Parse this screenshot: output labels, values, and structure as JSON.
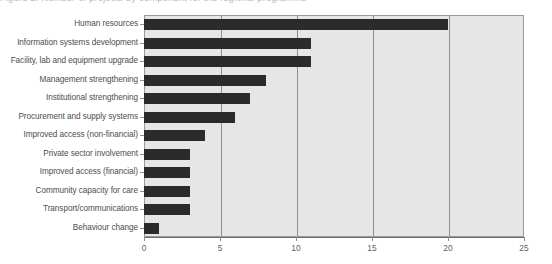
{
  "figure": {
    "cut_off_title": "Figure 2. Number of projects by component for the regional programme",
    "plot_background_color": "#e6e6e6",
    "bar_color": "#2b2b2b",
    "frame_color": "#9a9a9a",
    "gridline_color": "#8f8f8f"
  },
  "chart_data": {
    "type": "bar",
    "orientation": "horizontal",
    "title": "",
    "xlabel": "",
    "ylabel": "",
    "xlim": [
      0,
      25
    ],
    "ylim": null,
    "grid": "vertical",
    "legend": "none",
    "xticks": [
      "0",
      "5",
      "10",
      "15",
      "20",
      "25"
    ],
    "xtick_values": [
      0,
      5,
      10,
      15,
      20,
      25
    ],
    "categories": [
      "Human resources",
      "Information systems development",
      "Facility, lab and equipment upgrade",
      "Management strengthening",
      "Institutional strengthening",
      "Procurement and supply systems",
      "Improved access (non-financial)",
      "Private sector involvement",
      "Improved access (financial)",
      "Community capacity for care",
      "Transport/communications",
      "Behaviour change"
    ],
    "values": [
      20,
      11,
      11,
      8,
      7,
      6,
      4,
      3,
      3,
      3,
      3,
      1
    ],
    "series": [
      {
        "name": "Number of projects",
        "values": [
          20,
          11,
          11,
          8,
          7,
          6,
          4,
          3,
          3,
          3,
          3,
          1
        ]
      }
    ]
  }
}
